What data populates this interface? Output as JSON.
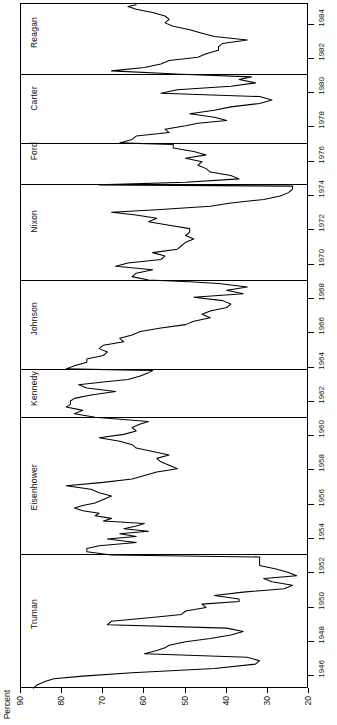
{
  "chart_data": {
    "type": "line",
    "title": "",
    "xlabel": "Percent",
    "ylabel": "",
    "orientation": "rotated-90",
    "grid": false,
    "legend": "none",
    "xlim": [
      90,
      20
    ],
    "ylim": [
      1945.25,
      1985.2
    ],
    "x_ticks": [
      90,
      80,
      70,
      60,
      50,
      40,
      30,
      20
    ],
    "x_tick_labels": [
      "90",
      "80",
      "70",
      "60",
      "50",
      "40",
      "30",
      "20"
    ],
    "y_ticks": [
      1946,
      1948,
      1950,
      1952,
      1954,
      1956,
      1958,
      1960,
      1962,
      1964,
      1966,
      1968,
      1970,
      1972,
      1974,
      1976,
      1978,
      1980,
      1982,
      1984
    ],
    "y_tick_labels": [
      "1946",
      "1948",
      "1950",
      "1952",
      "1954",
      "1956",
      "1958",
      "1960",
      "1962",
      "1964",
      "1966",
      "1968",
      "1970",
      "1972",
      "1974",
      "1976",
      "1978",
      "1980",
      "1982",
      "1984"
    ],
    "panel_boundaries": [
      1953.05,
      1961.05,
      1963.87,
      1969.05,
      1974.62,
      1977.05,
      1981.05
    ],
    "panels": [
      {
        "name": "Reagan",
        "start": 1981.05,
        "end": 1985.2
      },
      {
        "name": "Carter",
        "start": 1977.05,
        "end": 1981.05
      },
      {
        "name": "Ford",
        "start": 1974.62,
        "end": 1977.05
      },
      {
        "name": "Nixon",
        "start": 1969.05,
        "end": 1974.62
      },
      {
        "name": "Johnson",
        "start": 1963.87,
        "end": 1969.05
      },
      {
        "name": "Kennedy",
        "start": 1961.05,
        "end": 1963.87
      },
      {
        "name": "Eisenhower",
        "start": 1953.05,
        "end": 1961.05
      },
      {
        "name": "Truman",
        "start": 1945.25,
        "end": 1953.05
      }
    ],
    "series": [
      {
        "name": "Presidential approval",
        "units": "percent approving",
        "points": [
          [
            1945.3,
            87
          ],
          [
            1945.5,
            86
          ],
          [
            1945.7,
            84
          ],
          [
            1945.85,
            82
          ],
          [
            1946.0,
            75
          ],
          [
            1946.2,
            63
          ],
          [
            1946.45,
            43
          ],
          [
            1946.7,
            33
          ],
          [
            1946.9,
            32
          ],
          [
            1947.1,
            35
          ],
          [
            1947.3,
            60
          ],
          [
            1947.5,
            57
          ],
          [
            1947.65,
            55
          ],
          [
            1947.8,
            54
          ],
          [
            1948.0,
            50
          ],
          [
            1948.2,
            44
          ],
          [
            1948.4,
            39
          ],
          [
            1948.6,
            36
          ],
          [
            1948.8,
            40
          ],
          [
            1949.0,
            69
          ],
          [
            1949.2,
            68
          ],
          [
            1949.45,
            57
          ],
          [
            1949.6,
            51
          ],
          [
            1949.8,
            50
          ],
          [
            1950.0,
            45
          ],
          [
            1950.2,
            46
          ],
          [
            1950.35,
            37
          ],
          [
            1950.5,
            37
          ],
          [
            1950.7,
            43
          ],
          [
            1950.9,
            36
          ],
          [
            1951.1,
            26
          ],
          [
            1951.3,
            24
          ],
          [
            1951.5,
            29
          ],
          [
            1951.7,
            31
          ],
          [
            1951.85,
            23
          ],
          [
            1952.05,
            25
          ],
          [
            1952.25,
            28
          ],
          [
            1952.45,
            32
          ],
          [
            1952.6,
            32
          ],
          [
            1952.8,
            32
          ],
          [
            1952.95,
            32
          ],
          [
            1953.07,
            68
          ],
          [
            1953.25,
            74
          ],
          [
            1953.45,
            74
          ],
          [
            1953.6,
            71
          ],
          [
            1953.8,
            62
          ],
          [
            1954.0,
            69
          ],
          [
            1954.15,
            62
          ],
          [
            1954.3,
            66
          ],
          [
            1954.45,
            59
          ],
          [
            1954.6,
            65
          ],
          [
            1954.75,
            62
          ],
          [
            1954.9,
            60
          ],
          [
            1955.05,
            70
          ],
          [
            1955.2,
            68
          ],
          [
            1955.35,
            72
          ],
          [
            1955.5,
            71
          ],
          [
            1955.65,
            75
          ],
          [
            1955.8,
            77
          ],
          [
            1955.95,
            75
          ],
          [
            1956.1,
            72
          ],
          [
            1956.3,
            70
          ],
          [
            1956.5,
            68
          ],
          [
            1956.7,
            71
          ],
          [
            1956.9,
            73
          ],
          [
            1957.1,
            79
          ],
          [
            1957.3,
            70
          ],
          [
            1957.5,
            63
          ],
          [
            1957.7,
            60
          ],
          [
            1957.9,
            57
          ],
          [
            1958.1,
            52
          ],
          [
            1958.3,
            54
          ],
          [
            1958.5,
            56
          ],
          [
            1958.7,
            57
          ],
          [
            1958.9,
            54
          ],
          [
            1959.1,
            58
          ],
          [
            1959.3,
            62
          ],
          [
            1959.5,
            63
          ],
          [
            1959.7,
            66
          ],
          [
            1959.9,
            71
          ],
          [
            1960.1,
            65
          ],
          [
            1960.3,
            62
          ],
          [
            1960.5,
            63
          ],
          [
            1960.7,
            61
          ],
          [
            1960.85,
            59
          ],
          [
            1961.1,
            72
          ],
          [
            1961.3,
            77
          ],
          [
            1961.5,
            75
          ],
          [
            1961.7,
            79
          ],
          [
            1961.85,
            78
          ],
          [
            1962.05,
            78
          ],
          [
            1962.2,
            77
          ],
          [
            1962.4,
            73
          ],
          [
            1962.6,
            67
          ],
          [
            1962.8,
            74
          ],
          [
            1963.0,
            76
          ],
          [
            1963.15,
            70
          ],
          [
            1963.3,
            64
          ],
          [
            1963.5,
            61
          ],
          [
            1963.7,
            59
          ],
          [
            1963.82,
            58
          ],
          [
            1963.92,
            79
          ],
          [
            1964.1,
            77
          ],
          [
            1964.3,
            74
          ],
          [
            1964.5,
            74
          ],
          [
            1964.7,
            70
          ],
          [
            1964.9,
            69
          ],
          [
            1965.1,
            71
          ],
          [
            1965.3,
            70
          ],
          [
            1965.5,
            65
          ],
          [
            1965.7,
            66
          ],
          [
            1965.9,
            63
          ],
          [
            1966.1,
            61
          ],
          [
            1966.3,
            56
          ],
          [
            1966.5,
            50
          ],
          [
            1966.7,
            48
          ],
          [
            1966.9,
            44
          ],
          [
            1967.1,
            46
          ],
          [
            1967.3,
            44
          ],
          [
            1967.5,
            40
          ],
          [
            1967.7,
            39
          ],
          [
            1967.9,
            41
          ],
          [
            1968.1,
            48
          ],
          [
            1968.3,
            36
          ],
          [
            1968.5,
            40
          ],
          [
            1968.7,
            35
          ],
          [
            1968.9,
            42
          ],
          [
            1969.0,
            49
          ],
          [
            1969.1,
            59
          ],
          [
            1969.3,
            63
          ],
          [
            1969.5,
            62
          ],
          [
            1969.7,
            58
          ],
          [
            1969.9,
            67
          ],
          [
            1970.1,
            64
          ],
          [
            1970.3,
            56
          ],
          [
            1970.5,
            55
          ],
          [
            1970.7,
            58
          ],
          [
            1970.9,
            52
          ],
          [
            1971.1,
            51
          ],
          [
            1971.3,
            50
          ],
          [
            1971.5,
            48
          ],
          [
            1971.7,
            50
          ],
          [
            1971.9,
            49
          ],
          [
            1972.1,
            49
          ],
          [
            1972.3,
            54
          ],
          [
            1972.5,
            59
          ],
          [
            1972.7,
            57
          ],
          [
            1972.9,
            62
          ],
          [
            1973.05,
            68
          ],
          [
            1973.2,
            57
          ],
          [
            1973.4,
            44
          ],
          [
            1973.6,
            39
          ],
          [
            1973.8,
            31
          ],
          [
            1974.0,
            27
          ],
          [
            1974.2,
            25
          ],
          [
            1974.4,
            24
          ],
          [
            1974.58,
            24
          ],
          [
            1974.65,
            71
          ],
          [
            1974.8,
            50
          ],
          [
            1975.0,
            37
          ],
          [
            1975.2,
            39
          ],
          [
            1975.4,
            44
          ],
          [
            1975.6,
            45
          ],
          [
            1975.8,
            47
          ],
          [
            1976.0,
            46
          ],
          [
            1976.2,
            50
          ],
          [
            1976.4,
            45
          ],
          [
            1976.6,
            48
          ],
          [
            1976.8,
            53
          ],
          [
            1977.0,
            53
          ],
          [
            1977.1,
            66
          ],
          [
            1977.3,
            63
          ],
          [
            1977.5,
            62
          ],
          [
            1977.7,
            54
          ],
          [
            1977.9,
            55
          ],
          [
            1978.1,
            50
          ],
          [
            1978.25,
            47
          ],
          [
            1978.4,
            40
          ],
          [
            1978.6,
            43
          ],
          [
            1978.8,
            49
          ],
          [
            1979.0,
            43
          ],
          [
            1979.2,
            39
          ],
          [
            1979.4,
            32
          ],
          [
            1979.6,
            29
          ],
          [
            1979.8,
            32
          ],
          [
            1980.0,
            56
          ],
          [
            1980.2,
            52
          ],
          [
            1980.4,
            39
          ],
          [
            1980.6,
            33
          ],
          [
            1980.8,
            37
          ],
          [
            1980.95,
            34
          ],
          [
            1981.1,
            51
          ],
          [
            1981.3,
            68
          ],
          [
            1981.5,
            60
          ],
          [
            1981.7,
            56
          ],
          [
            1981.9,
            54
          ],
          [
            1982.1,
            47
          ],
          [
            1982.3,
            45
          ],
          [
            1982.5,
            42
          ],
          [
            1982.7,
            42
          ],
          [
            1982.9,
            41
          ],
          [
            1983.1,
            35
          ],
          [
            1983.3,
            43
          ],
          [
            1983.5,
            46
          ],
          [
            1983.7,
            49
          ],
          [
            1983.9,
            53
          ],
          [
            1984.1,
            55
          ],
          [
            1984.3,
            54
          ],
          [
            1984.5,
            55
          ],
          [
            1984.7,
            58
          ],
          [
            1984.9,
            62
          ],
          [
            1985.05,
            64
          ],
          [
            1985.15,
            62
          ]
        ]
      }
    ]
  },
  "axes": {
    "percent_title": "Percent"
  }
}
